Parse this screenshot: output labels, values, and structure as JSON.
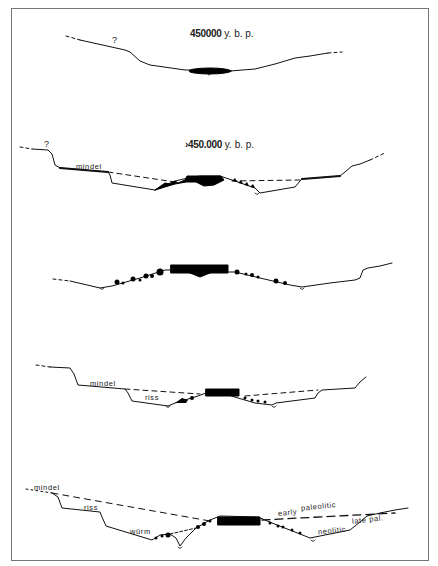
{
  "figure": {
    "panels": [
      {
        "id": "panel-1",
        "date_value": "450000",
        "date_unit": "y. b. p.",
        "annotations": [
          "?"
        ]
      },
      {
        "id": "panel-2",
        "date_value": "›450.000",
        "date_unit": "y. b. p.",
        "annotations": [
          "?",
          "mindel"
        ]
      },
      {
        "id": "panel-3",
        "annotations": []
      },
      {
        "id": "panel-4",
        "annotations": [
          "mindel",
          "riss"
        ]
      },
      {
        "id": "panel-5",
        "annotations": [
          "mindel",
          "riss",
          "würm",
          "early",
          "paleolitic",
          "late pal.",
          "neolitic"
        ]
      }
    ],
    "colors": {
      "line": "#111111",
      "fill": "#000000",
      "border": "#777777",
      "background": "#ffffff"
    }
  }
}
